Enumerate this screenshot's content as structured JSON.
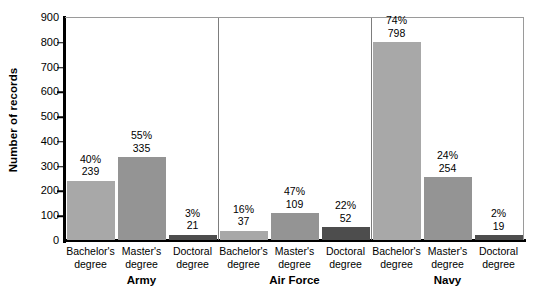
{
  "chart_data": {
    "type": "bar",
    "title": "",
    "xlabel": "",
    "ylabel": "Number of records",
    "ylim": [
      0,
      900
    ],
    "ytick_values": [
      0,
      100,
      200,
      300,
      400,
      500,
      600,
      700,
      800,
      900
    ],
    "ytick_labels": [
      "0",
      "100",
      "200",
      "300",
      "400",
      "500",
      "600",
      "700",
      "800",
      "900"
    ],
    "grid": false,
    "legend": "none",
    "categories": [
      "Bachelor's degree",
      "Master's degree",
      "Doctoral degree"
    ],
    "groups": [
      {
        "name": "Army",
        "bars": [
          {
            "category_line1": "Bachelor's",
            "category_line2": "degree",
            "value": 239,
            "percent": "40%",
            "value_label": "239",
            "color": "#a8a8a8"
          },
          {
            "category_line1": "Master's",
            "category_line2": "degree",
            "value": 335,
            "percent": "55%",
            "value_label": "335",
            "color": "#949494"
          },
          {
            "category_line1": "Doctoral",
            "category_line2": "degree",
            "value": 21,
            "percent": "3%",
            "value_label": "21",
            "color": "#4d4d4d"
          }
        ]
      },
      {
        "name": "Air Force",
        "bars": [
          {
            "category_line1": "Bachelor's",
            "category_line2": "degree",
            "value": 37,
            "percent": "16%",
            "value_label": "37",
            "color": "#a8a8a8"
          },
          {
            "category_line1": "Master's",
            "category_line2": "degree",
            "value": 109,
            "percent": "47%",
            "value_label": "109",
            "color": "#949494"
          },
          {
            "category_line1": "Doctoral",
            "category_line2": "degree",
            "value": 52,
            "percent": "22%",
            "value_label": "52",
            "color": "#4d4d4d"
          }
        ]
      },
      {
        "name": "Navy",
        "bars": [
          {
            "category_line1": "Bachelor's",
            "category_line2": "degree",
            "value": 798,
            "percent": "74%",
            "value_label": "798",
            "color": "#a8a8a8"
          },
          {
            "category_line1": "Master's",
            "category_line2": "degree",
            "value": 254,
            "percent": "24%",
            "value_label": "254",
            "color": "#949494"
          },
          {
            "category_line1": "Doctoral",
            "category_line2": "degree",
            "value": 19,
            "percent": "2%",
            "value_label": "19",
            "color": "#4d4d4d"
          }
        ]
      }
    ],
    "series": [
      {
        "name": "Bachelor's degree",
        "values": [
          239,
          37,
          798
        ],
        "percents": [
          "40%",
          "16%",
          "74%"
        ]
      },
      {
        "name": "Master's degree",
        "values": [
          335,
          109,
          254
        ],
        "percents": [
          "55%",
          "47%",
          "24%"
        ]
      },
      {
        "name": "Doctoral degree",
        "values": [
          21,
          52,
          19
        ],
        "percents": [
          "3%",
          "22%",
          "2%"
        ]
      }
    ]
  }
}
